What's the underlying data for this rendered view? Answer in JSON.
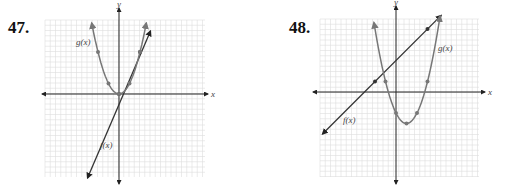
{
  "chart_data": [
    {
      "type": "line",
      "problem": "47.",
      "xlabel": "x",
      "ylabel": "y",
      "grid": true,
      "xlim": [
        -7,
        8
      ],
      "ylim": [
        -8,
        6
      ],
      "series": [
        {
          "name": "f(x)",
          "color": "#333333",
          "points": [
            [
              -3,
              -8
            ],
            [
              0,
              0
            ],
            [
              2,
              4
            ],
            [
              3,
              6
            ]
          ],
          "marked": [
            [
              0,
              0
            ],
            [
              2,
              4
            ]
          ]
        },
        {
          "name": "g(x)",
          "color": "#777777",
          "points": [
            [
              -2.6,
              6.5
            ],
            [
              -2,
              4
            ],
            [
              -1,
              1
            ],
            [
              0,
              0
            ],
            [
              1,
              1
            ],
            [
              2,
              4
            ],
            [
              2.6,
              6.5
            ]
          ],
          "marked": [
            [
              -2,
              4
            ],
            [
              -1,
              1
            ],
            [
              0,
              0
            ],
            [
              1,
              1
            ],
            [
              2,
              4
            ]
          ]
        }
      ]
    },
    {
      "type": "line",
      "problem": "48.",
      "xlabel": "x",
      "ylabel": "y",
      "grid": true,
      "xlim": [
        -7,
        8
      ],
      "ylim": [
        -8,
        7
      ],
      "series": [
        {
          "name": "f(x)",
          "color": "#333333",
          "points": [
            [
              -7,
              -4
            ],
            [
              -2,
              1
            ],
            [
              3,
              6
            ],
            [
              4.3,
              7.3
            ]
          ],
          "marked": [
            [
              -2,
              1
            ],
            [
              3,
              6
            ]
          ]
        },
        {
          "name": "g(x)",
          "color": "#777777",
          "points": [
            [
              -2.1,
              6.7
            ],
            [
              -1,
              1
            ],
            [
              0,
              -2
            ],
            [
              1,
              -3
            ],
            [
              2,
              -2
            ],
            [
              3,
              1
            ],
            [
              4.2,
              7.3
            ]
          ],
          "marked": [
            [
              -1,
              1
            ],
            [
              0,
              -2
            ],
            [
              1,
              -3
            ],
            [
              2,
              -2
            ],
            [
              3,
              1
            ]
          ]
        }
      ]
    }
  ],
  "labels": {
    "p47": "47.",
    "p48": "48.",
    "x": "x",
    "y": "y",
    "f": "f(x)",
    "g": "g(x)"
  }
}
